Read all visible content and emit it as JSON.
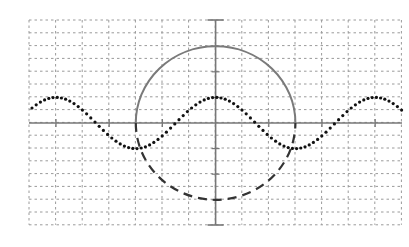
{
  "figure": {
    "width": 409,
    "height": 247,
    "background": "#ffffff"
  },
  "grid": {
    "x0": 29,
    "y0": 20,
    "cell_w": 26.6,
    "cell_h": 12.8,
    "cols": 14,
    "rows": 16,
    "color": "#9a9a9a",
    "dash": "2.5 3"
  },
  "axes": {
    "origin_x": 215.6,
    "origin_y": 123,
    "x_from": 29,
    "x_to": 402,
    "y_from": 20,
    "y_to": 225,
    "color": "#777777",
    "width": 1.6,
    "tick_half": 4,
    "x_tick_step_px": 53.2,
    "y_tick_step_px": 25.6,
    "end_cap_half": 8
  },
  "circle": {
    "cx": 215.6,
    "cy": 123,
    "rx": 79.8,
    "ry": 76.8,
    "upper": {
      "style": "solid",
      "color": "#7a7a7a",
      "width": 2
    },
    "lower": {
      "style": "dashed",
      "color": "#333333",
      "width": 2.2,
      "dash": "9 6"
    }
  },
  "wave": {
    "type": "cosine",
    "x_start": 32,
    "x_end": 402,
    "center_y": 123,
    "amplitude_px": 25.6,
    "period_px": 159.6,
    "phase_x": 215.6,
    "dot_step_px": 4.2,
    "dot_radius": 1.6,
    "color": "#111111"
  },
  "chart_data": {
    "type": "line",
    "title": "",
    "xlabel": "",
    "ylabel": "",
    "grid": true,
    "series": [
      {
        "name": "cosine wave (dotted)",
        "function": "y = 2*cos(pi*x/3)",
        "x_range": [
          -7,
          7
        ],
        "style": "dotted"
      },
      {
        "name": "upper semicircle (solid)",
        "function": "(x/3)^2 + (y/6)^2 = 1, y >= 0",
        "x_range": [
          -3,
          3
        ],
        "style": "solid"
      },
      {
        "name": "lower semicircle (dashed)",
        "function": "(x/3)^2 + (y/6)^2 = 1, y <= 0",
        "x_range": [
          -3,
          3
        ],
        "style": "dashed"
      }
    ],
    "xlim": [
      -7,
      7
    ],
    "ylim": [
      -8,
      8
    ]
  }
}
